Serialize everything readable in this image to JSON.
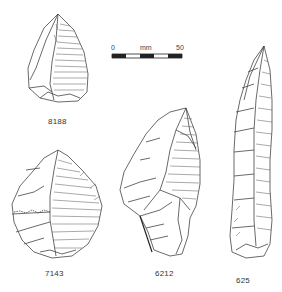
{
  "figure": {
    "type": "archaeological lithic illustration plate",
    "artifacts": [
      {
        "id": "8188",
        "label": "8188",
        "description": "small pointed flake"
      },
      {
        "id": "7143",
        "label": "7143",
        "description": "broad flake"
      },
      {
        "id": "6212",
        "label": "6212",
        "description": "pointed flake"
      },
      {
        "id": "625",
        "label": "625",
        "description": "elongated blade"
      }
    ],
    "scale_bar": {
      "start_label": "0",
      "unit_label": "mm",
      "end_label": "50"
    }
  }
}
